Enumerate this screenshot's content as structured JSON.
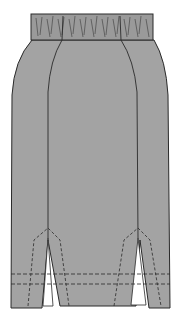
{
  "figure": {
    "colors": {
      "background": "#ffffff",
      "fabric": "#a3a3a3",
      "waistband": "#9a9a9a",
      "outline": "#2a2a2a"
    }
  }
}
